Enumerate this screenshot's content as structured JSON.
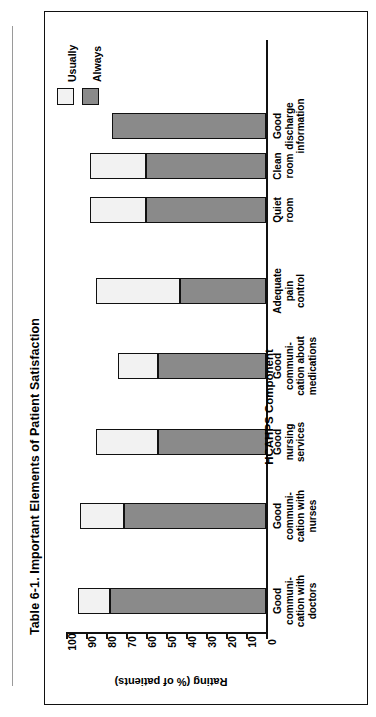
{
  "caption": "Table 6-1.  Important Elements of Patient Satisfaction",
  "legend": {
    "entries": [
      {
        "label": "Usually",
        "color": "#f2f2f2"
      },
      {
        "label": "Always",
        "color": "#8a8a8a"
      }
    ]
  },
  "chart_data": {
    "type": "bar",
    "orientation": "horizontal-stacked",
    "title": "Table 6-1.  Important Elements of Patient Satisfaction",
    "xlabel": "HCAHPS Component",
    "ylabel": "Rating (% of patients)",
    "ylim": [
      0,
      100
    ],
    "ytick_labels": [
      "0",
      "10",
      "20",
      "30",
      "40",
      "50",
      "60",
      "70",
      "80",
      "90",
      "100"
    ],
    "ytick_values": [
      0,
      10,
      20,
      30,
      40,
      50,
      60,
      70,
      80,
      90,
      100
    ],
    "grid": false,
    "legend_position": "top-left",
    "categories": [
      "Good communi-cation with doctors",
      "Good communi-cation with nurses",
      "Good nursing services",
      "Good communi-cation about medications",
      "Adequate pain control",
      "Quiet room",
      "Clean room",
      "Good discharge information"
    ],
    "category_lines": [
      [
        "Good",
        "communi-",
        "cation with",
        "doctors"
      ],
      [
        "Good",
        "communi-",
        "cation with",
        "nurses"
      ],
      [
        "Good",
        "nursing",
        "services"
      ],
      [
        "Good",
        "communi-",
        "cation about",
        "medications"
      ],
      [
        "Adequate",
        "pain",
        "control"
      ],
      [
        "Quiet",
        "room"
      ],
      [
        "Clean",
        "room"
      ],
      [
        "Good",
        "discharge",
        "information"
      ]
    ],
    "series": [
      {
        "name": "Always",
        "values": [
          78,
          71,
          54,
          54,
          43,
          60,
          60,
          77
        ]
      },
      {
        "name": "Usually",
        "values": [
          16,
          22,
          31,
          20,
          42,
          28,
          28,
          0
        ]
      }
    ],
    "totals": [
      94,
      93,
      85,
      74,
      85,
      88,
      88,
      77
    ]
  }
}
